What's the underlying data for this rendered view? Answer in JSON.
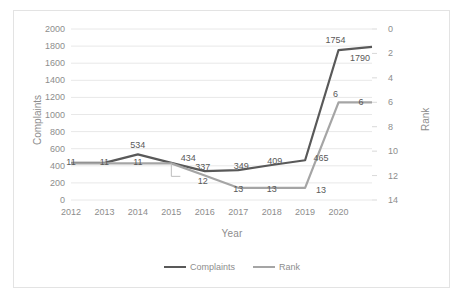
{
  "chart_data": {
    "type": "line",
    "title": "",
    "xlabel": "Year",
    "ylabel": "Complaints",
    "y2label": "Rank",
    "grid": true,
    "legend_position": "bottom",
    "categories": [
      "2012",
      "2013",
      "2014",
      "2015",
      "2016",
      "2017",
      "2018",
      "2019",
      "2020",
      ""
    ],
    "x_tick_labels": [
      "2012",
      "2013",
      "2014",
      "2015",
      "2016",
      "2017",
      "2018",
      "2019",
      "2020"
    ],
    "ylim": [
      0,
      2000
    ],
    "y_ticks": [
      0,
      200,
      400,
      600,
      800,
      1000,
      1200,
      1400,
      1600,
      1800,
      2000
    ],
    "y_tick_labels": [
      "0",
      "200",
      "400",
      "600",
      "800",
      "1000",
      "1200",
      "1400",
      "1600",
      "1800",
      "2000"
    ],
    "y2lim": [
      14,
      0
    ],
    "y2_inverted": true,
    "y2_ticks": [
      0,
      2,
      4,
      6,
      8,
      10,
      12,
      14
    ],
    "y2_tick_labels": [
      "0",
      "2",
      "4",
      "6",
      "8",
      "10",
      "12",
      "14"
    ],
    "series": [
      {
        "name": "Complaints",
        "axis": "left",
        "color": "#595959",
        "values": [
          434,
          434,
          534,
          434,
          337,
          349,
          409,
          465,
          1754,
          1790
        ],
        "point_labels": [
          "",
          "",
          "534",
          "434",
          "337",
          "349",
          "409",
          "465",
          "1754",
          "1790"
        ]
      },
      {
        "name": "Rank",
        "axis": "right",
        "color": "#a5a5a5",
        "values": [
          11,
          11,
          11,
          11,
          12,
          13,
          13,
          13,
          6,
          6
        ],
        "point_labels": [
          "11",
          "11",
          "11",
          "",
          "12",
          "13",
          "13",
          "13",
          "6",
          "6"
        ]
      }
    ]
  },
  "legend": {
    "items": [
      {
        "label": "Complaints",
        "color": "#595959"
      },
      {
        "label": "Rank",
        "color": "#a5a5a5"
      }
    ]
  },
  "axes": {
    "x_title": "Year",
    "y_left_title": "Complaints",
    "y_right_title": "Rank"
  }
}
